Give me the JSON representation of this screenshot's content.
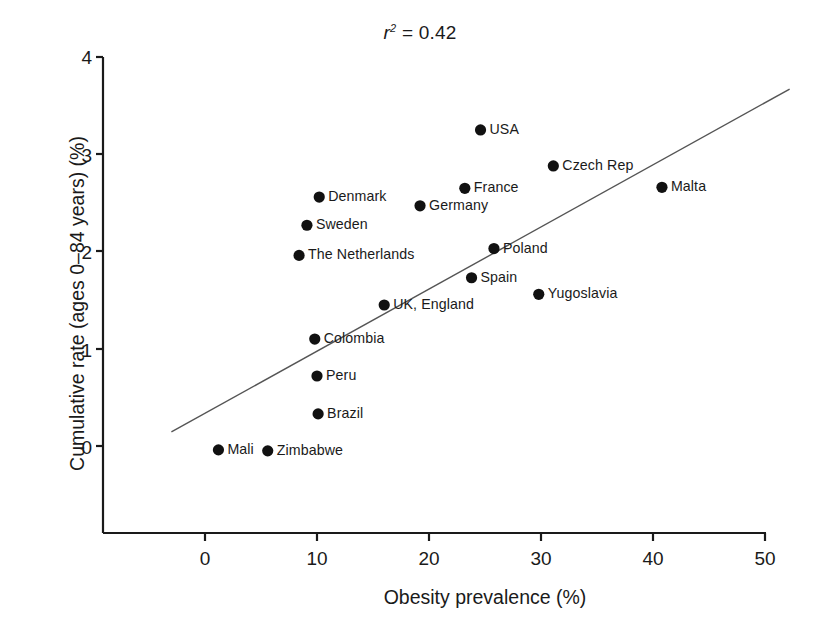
{
  "figure": {
    "title_prefix": "r",
    "title_sup": "2",
    "title_suffix": " = 0.42",
    "title_plain": "r2 = 0.42"
  },
  "axes": {
    "x_label": "Obesity prevalence (%)",
    "y_label": "Cumulative rate (ages 0–84 years) (%)",
    "x_ticks": [
      "0",
      "10",
      "20",
      "30",
      "40",
      "50"
    ],
    "y_ticks": [
      "0",
      "1",
      "2",
      "3",
      "4"
    ]
  },
  "chart_data": {
    "type": "scatter",
    "title": "r2 = 0.42",
    "xlabel": "Obesity prevalence (%)",
    "ylabel": "Cumulative rate (ages 0–84 years) (%)",
    "xlim": [
      -3,
      50
    ],
    "ylim": [
      -0.9,
      4
    ],
    "grid": false,
    "legend": null,
    "r_squared": 0.42,
    "points": [
      {
        "label": "USA",
        "x": 24.6,
        "y": 3.25,
        "label_side": "right"
      },
      {
        "label": "Czech Rep",
        "x": 31.1,
        "y": 2.88,
        "label_side": "right"
      },
      {
        "label": "Malta",
        "x": 40.8,
        "y": 2.66,
        "label_side": "right"
      },
      {
        "label": "France",
        "x": 23.2,
        "y": 2.65,
        "label_side": "right"
      },
      {
        "label": "Denmark",
        "x": 10.2,
        "y": 2.56,
        "label_side": "right"
      },
      {
        "label": "Germany",
        "x": 19.2,
        "y": 2.47,
        "label_side": "right"
      },
      {
        "label": "Sweden",
        "x": 9.1,
        "y": 2.27,
        "label_side": "right"
      },
      {
        "label": "Poland",
        "x": 25.8,
        "y": 2.03,
        "label_side": "right"
      },
      {
        "label": "The Netherlands",
        "x": 8.4,
        "y": 1.96,
        "label_side": "right"
      },
      {
        "label": "Spain",
        "x": 23.8,
        "y": 1.73,
        "label_side": "right"
      },
      {
        "label": "Yugoslavia",
        "x": 29.8,
        "y": 1.56,
        "label_side": "right"
      },
      {
        "label": "UK, England",
        "x": 16.0,
        "y": 1.45,
        "label_side": "right"
      },
      {
        "label": "Colombia",
        "x": 9.8,
        "y": 1.1,
        "label_side": "right"
      },
      {
        "label": "Peru",
        "x": 10.0,
        "y": 0.72,
        "label_side": "right"
      },
      {
        "label": "Brazil",
        "x": 10.1,
        "y": 0.33,
        "label_side": "right"
      },
      {
        "label": "Mali",
        "x": 1.2,
        "y": -0.04,
        "label_side": "right"
      },
      {
        "label": "Zimbabwe",
        "x": 5.6,
        "y": -0.05,
        "label_side": "right"
      }
    ],
    "fit_line": {
      "type": "linear",
      "x_start": -3.0,
      "y_start": 0.145,
      "x_end": 52.2,
      "y_end": 3.67
    },
    "colors": {
      "marker": "#111111",
      "line": "#555555",
      "axis": "#1a1a1a",
      "text": "#1a1a1a"
    }
  }
}
